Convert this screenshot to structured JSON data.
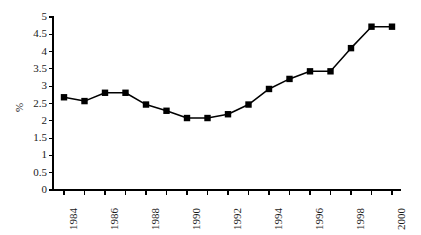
{
  "chart_data": {
    "type": "line",
    "title": "",
    "xlabel": "",
    "ylabel": "%",
    "ylim": [
      0,
      5
    ],
    "ytick_step": 0.5,
    "grid": false,
    "legend": null,
    "marker": "square",
    "line_color": "#000000",
    "marker_color": "#000000",
    "axis_color": "#000000",
    "x": [
      1984,
      1985,
      1986,
      1987,
      1988,
      1989,
      1990,
      1991,
      1992,
      1993,
      1994,
      1995,
      1996,
      1997,
      1998,
      1999,
      2000
    ],
    "values": [
      2.68,
      2.57,
      2.81,
      2.81,
      2.47,
      2.29,
      2.08,
      2.08,
      2.19,
      2.47,
      2.92,
      3.21,
      3.43,
      3.43,
      4.1,
      4.72,
      4.72
    ],
    "ytick_labels": [
      "0",
      "0.5",
      "1",
      "1.5",
      "2",
      "2.5",
      "3",
      "3.5",
      "4",
      "4.5",
      "5"
    ],
    "ytick_values": [
      0,
      0.5,
      1,
      1.5,
      2,
      2.5,
      3,
      3.5,
      4,
      4.5,
      5
    ],
    "xtick_labels": [
      "1984",
      "1986",
      "1988",
      "1990",
      "1992",
      "1994",
      "1996",
      "1998",
      "2000"
    ],
    "xtick_values": [
      1984,
      1986,
      1988,
      1990,
      1992,
      1994,
      1996,
      1998,
      2000
    ]
  }
}
